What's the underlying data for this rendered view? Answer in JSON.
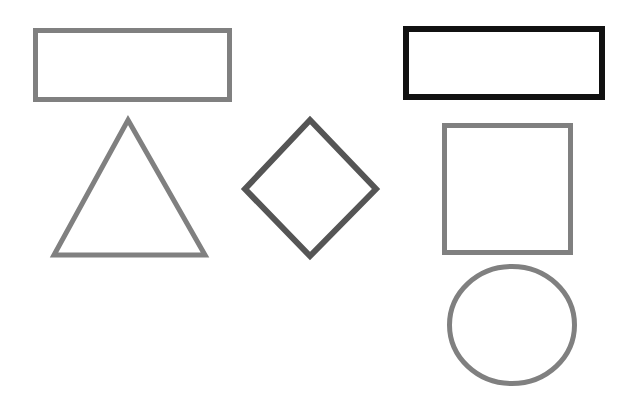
{
  "canvas": {
    "width": 632,
    "height": 420,
    "background_color": "#ffffff",
    "title": "Geometric Shapes Outline Diagram"
  },
  "palette": {
    "gray": "#808080",
    "dark_gray": "#555555",
    "black": "#111111",
    "background": "#ffffff"
  },
  "shapes": [
    {
      "id": "rectangle-gray-top-left",
      "name": "Gray Rectangle",
      "type": "rectangle",
      "stroke_color": "#808080",
      "fill": "none",
      "stroke_width": 5,
      "x": 33,
      "y": 28,
      "width": 199,
      "height": 74
    },
    {
      "id": "rectangle-black-top-right",
      "name": "Black Rectangle",
      "type": "rectangle",
      "stroke_color": "#111111",
      "fill": "none",
      "stroke_width": 6,
      "x": 403,
      "y": 26,
      "width": 202,
      "height": 74
    },
    {
      "id": "triangle-gray-left",
      "name": "Gray Triangle",
      "type": "triangle",
      "stroke_color": "#808080",
      "fill": "none",
      "stroke_width": 5,
      "points": "128,120 205,255 54,255",
      "apex_x": 128,
      "apex_y": 120,
      "base_left_x": 54,
      "base_right_x": 205,
      "base_y": 255
    },
    {
      "id": "diamond-dark-center",
      "name": "Dark Gray Diamond",
      "type": "diamond",
      "stroke_color": "#555555",
      "fill": "none",
      "stroke_width": 6,
      "points": "310,120 376,189 310,256 245,189",
      "center_x": 310,
      "center_y": 189,
      "half_width": 66,
      "half_height": 68
    },
    {
      "id": "square-gray-right",
      "name": "Gray Square",
      "type": "square",
      "stroke_color": "#808080",
      "fill": "none",
      "stroke_width": 5,
      "x": 442,
      "y": 123,
      "width": 131,
      "height": 132
    },
    {
      "id": "circle-gray-bottom-right",
      "name": "Gray Circle",
      "type": "circle",
      "stroke_color": "#808080",
      "fill": "none",
      "stroke_width": 5,
      "center_x": 512,
      "center_y": 325,
      "radius_x": 65,
      "radius_y": 61
    }
  ],
  "summary": {
    "shape_count": 6,
    "shape_types": [
      "rectangle",
      "rectangle",
      "triangle",
      "diamond",
      "square",
      "circle"
    ]
  }
}
